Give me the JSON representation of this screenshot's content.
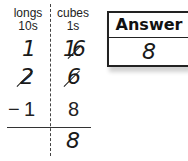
{
  "place_value_table": {
    "columns": [
      {
        "name": "longs",
        "unit": "10s"
      },
      {
        "name": "cubes",
        "unit": "1s"
      }
    ],
    "regrouped_row": {
      "longs": "1",
      "cubes": "16",
      "cubes_prefix": "1",
      "cubes_original": "6"
    },
    "minuend_row": {
      "longs": "2",
      "longs_crossed": true,
      "cubes": "6",
      "cubes_crossed": true
    },
    "subtrahend_row": {
      "operator": "−",
      "longs": "1",
      "cubes": "8"
    },
    "result_row": {
      "longs": "",
      "cubes": "8"
    }
  },
  "answer_box": {
    "label": "Answer",
    "value": "8"
  }
}
